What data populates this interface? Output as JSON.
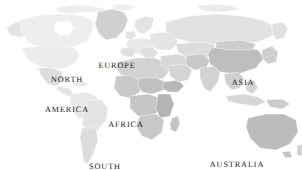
{
  "map": {
    "title": "World Map",
    "background_color": "#ffffff",
    "projection": "equirectangular",
    "label_color": "#262626",
    "ocean_color": "#ffffff",
    "land_colors": {
      "very_light": "#eeeeee",
      "light": "#e4e4e4",
      "light_mid": "#dcdcdc",
      "mid": "#d0d0d0",
      "mid_dark": "#c2c2c2",
      "dark": "#b2b2b2",
      "darkest": "#a2a2a2"
    },
    "border_color": "#ffffff",
    "labels": [
      {
        "id": "north-america",
        "text_lines": [
          "NORTH",
          "AMERICA"
        ],
        "x": 67,
        "y": 55
      },
      {
        "id": "europe",
        "text_lines": [
          "EUROPE"
        ],
        "x": 117,
        "y": 41
      },
      {
        "id": "asia",
        "text_lines": [
          "ASIA"
        ],
        "x": 243,
        "y": 58
      },
      {
        "id": "africa",
        "text_lines": [
          "AFRICA"
        ],
        "x": 126,
        "y": 100
      },
      {
        "id": "south-america",
        "text_lines": [
          "SOUTH",
          "AMERICA"
        ],
        "x": 105,
        "y": 142
      },
      {
        "id": "australia",
        "text_lines": [
          "AUSTRALIA"
        ],
        "x": 237,
        "y": 140
      }
    ],
    "regions": [
      {
        "name": "greenland",
        "shade": "mid"
      },
      {
        "name": "canada",
        "shade": "very_light"
      },
      {
        "name": "united-states",
        "shade": "very_light"
      },
      {
        "name": "alaska",
        "shade": "light"
      },
      {
        "name": "mexico",
        "shade": "light_mid"
      },
      {
        "name": "central-america",
        "shade": "light"
      },
      {
        "name": "brazil",
        "shade": "light"
      },
      {
        "name": "argentina",
        "shade": "light_mid"
      },
      {
        "name": "northern-africa",
        "shade": "mid"
      },
      {
        "name": "central-africa",
        "shade": "mid_dark"
      },
      {
        "name": "southern-africa",
        "shade": "mid"
      },
      {
        "name": "europe",
        "shade": "light"
      },
      {
        "name": "russia",
        "shade": "light_mid"
      },
      {
        "name": "middle-east",
        "shade": "light_mid"
      },
      {
        "name": "india",
        "shade": "light_mid"
      },
      {
        "name": "china",
        "shade": "mid_dark"
      },
      {
        "name": "southeast-asia",
        "shade": "light_mid"
      },
      {
        "name": "indonesia",
        "shade": "light_mid"
      },
      {
        "name": "australia",
        "shade": "mid_dark"
      },
      {
        "name": "new-zealand",
        "shade": "light_mid"
      },
      {
        "name": "japan",
        "shade": "light_mid"
      },
      {
        "name": "madagascar",
        "shade": "mid"
      }
    ]
  }
}
